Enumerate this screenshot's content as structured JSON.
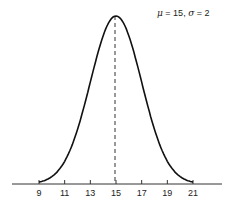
{
  "chart_data": {
    "type": "line",
    "title": "",
    "mu": 15,
    "sigma": 2,
    "annotation": "μ = 15,  σ = 2",
    "xlabel": "",
    "ylabel": "",
    "xticks": [
      9,
      11,
      13,
      15,
      17,
      19,
      21
    ],
    "xlim": [
      6.5,
      24.5
    ],
    "mean_line": {
      "x": 15,
      "style": "dashed"
    },
    "grid": false,
    "legend": "top-right annotation",
    "x": [
      9,
      10,
      11,
      12,
      13,
      14,
      15,
      16,
      17,
      18,
      19,
      20,
      21
    ],
    "values": [
      0.0022,
      0.0088,
      0.027,
      0.0648,
      0.121,
      0.176,
      0.1995,
      0.176,
      0.121,
      0.0648,
      0.027,
      0.0088,
      0.0022
    ]
  },
  "legend": {
    "mu_symbol": "μ",
    "mu_text": " = 15,  ",
    "sigma_symbol": "σ",
    "sigma_text": " = 2"
  },
  "ticks": [
    "9",
    "11",
    "13",
    "15",
    "17",
    "19",
    "21"
  ]
}
